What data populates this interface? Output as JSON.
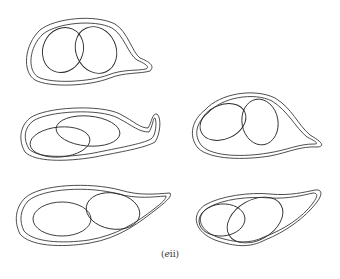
{
  "figure": {
    "caption_open": "(",
    "caption_italic": "e",
    "caption_roman": "ii",
    "caption_close": ")",
    "panel_count": 5,
    "panels": [
      {
        "id": "top-left",
        "description": "cell outline with double membrane, short tail pointing right, two overlapping ovals"
      },
      {
        "id": "middle-left",
        "description": "elongated cell outline with double membrane, upturned tail at right, two overlapping ovals"
      },
      {
        "id": "middle-right",
        "description": "rounded cell outline with double membrane, pointed tail at right, two overlapping ovals"
      },
      {
        "id": "bottom-left",
        "description": "teardrop cell outline with double membrane, tapering tail upper right, two adjacent ovals"
      },
      {
        "id": "bottom-right",
        "description": "teardrop cell outline with double membrane, tail upper right, two overlapping ovals"
      }
    ]
  }
}
